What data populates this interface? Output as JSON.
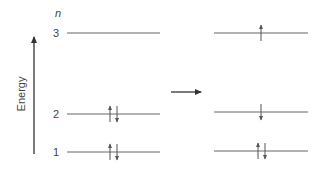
{
  "diagram": {
    "axis_label": "Energy",
    "quantum_number_label": "n",
    "levels": [
      {
        "n": "3",
        "left_electrons": [],
        "right_electrons": [
          "up"
        ]
      },
      {
        "n": "2",
        "left_electrons": [
          "up",
          "down"
        ],
        "right_electrons": [
          "down"
        ]
      },
      {
        "n": "1",
        "left_electrons": [
          "up",
          "down"
        ],
        "right_electrons": [
          "up",
          "down"
        ]
      }
    ],
    "colors": {
      "line": "#555555",
      "text": "#444444"
    }
  }
}
